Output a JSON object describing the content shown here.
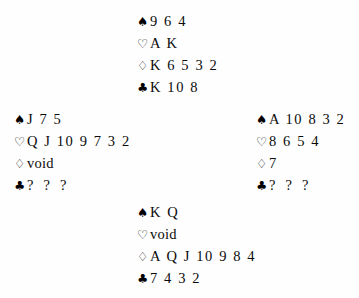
{
  "diagram": {
    "type": "bridge-deal-diagram",
    "suit_symbols": {
      "spade": "♠",
      "heart": "♡",
      "diamond": "♢",
      "club": "♣"
    },
    "hands": {
      "north": {
        "position": "North",
        "spades": "9 6 4",
        "hearts": "A K",
        "diamonds": "K 6 5 3 2",
        "clubs": "K 10 8"
      },
      "west": {
        "position": "West",
        "spades": "J 7 5",
        "hearts": "Q J 10 9 7 3 2",
        "diamonds": "void",
        "clubs": "? ? ?"
      },
      "east": {
        "position": "East",
        "spades": "A 10 8 3 2",
        "hearts": "8 6 5 4",
        "diamonds": "7",
        "clubs": "? ? ?"
      },
      "south": {
        "position": "South",
        "spades": "K Q",
        "hearts": "void",
        "diamonds": "A Q J 10 9 8 4",
        "clubs": "7 4 3 2"
      }
    }
  }
}
